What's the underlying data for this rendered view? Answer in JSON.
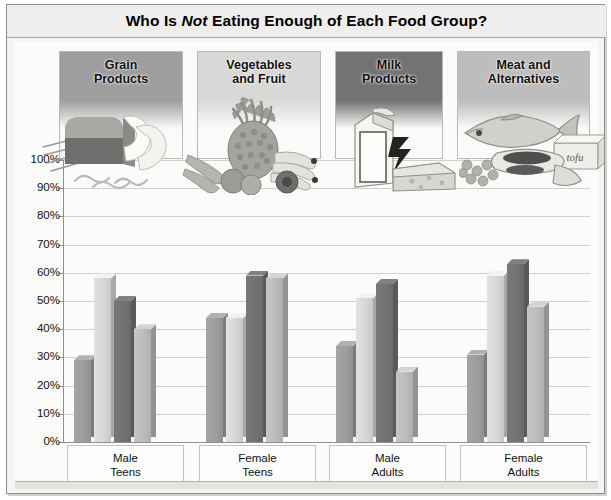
{
  "title": {
    "before": "Who Is ",
    "emphasis": "Not",
    "after": " Eating Enough of Each Food Group?"
  },
  "food_groups": [
    {
      "label": "Grain\nProducts",
      "swatch": "#9e9e9e",
      "art": "bread-loaf-pasta-image"
    },
    {
      "label": "Vegetables\nand Fruit",
      "swatch": "#d8d8d6",
      "art": "pineapple-bananas-vegetables-image"
    },
    {
      "label": "Milk\nProducts",
      "swatch": "#737373",
      "art": "milk-carton-cheese-image"
    },
    {
      "label": "Meat and\nAlternatives",
      "swatch": "#bdbdbd",
      "art": "fish-tofu-beans-image"
    }
  ],
  "tofu_caption": "tofu",
  "axis": {
    "ticks": [
      "100%",
      "90%",
      "80%",
      "70%",
      "60%",
      "50%",
      "40%",
      "30%",
      "20%",
      "10%",
      "0%"
    ]
  },
  "categories": [
    {
      "label": "Male\nTeens"
    },
    {
      "label": "Female\nTeens"
    },
    {
      "label": "Male\nAdults"
    },
    {
      "label": "Female\nAdults"
    }
  ],
  "chart_data": {
    "type": "bar",
    "title": "Who Is Not Eating Enough of Each Food Group?",
    "xlabel": "",
    "ylabel": "",
    "ylim": [
      0,
      100
    ],
    "ytick_values": [
      0,
      10,
      20,
      30,
      40,
      50,
      60,
      70,
      80,
      90,
      100
    ],
    "ytick_labels": [
      "0%",
      "10%",
      "20%",
      "30%",
      "40%",
      "50%",
      "60%",
      "70%",
      "80%",
      "90%",
      "100%"
    ],
    "grid": true,
    "legend_position": "top-panels",
    "units": "percent",
    "categories": [
      "Male Teens",
      "Female Teens",
      "Male Adults",
      "Female Adults"
    ],
    "series": [
      {
        "name": "Grain Products",
        "color": "#9e9e9e",
        "values": [
          29,
          44,
          34,
          31
        ]
      },
      {
        "name": "Vegetables and Fruit",
        "color": "#d8d8d6",
        "values": [
          58,
          44,
          51,
          59
        ]
      },
      {
        "name": "Milk Products",
        "color": "#737373",
        "values": [
          50,
          59,
          56,
          63
        ]
      },
      {
        "name": "Meat and Alternatives",
        "color": "#bdbdbd",
        "values": [
          40,
          58,
          25,
          48
        ]
      }
    ]
  }
}
